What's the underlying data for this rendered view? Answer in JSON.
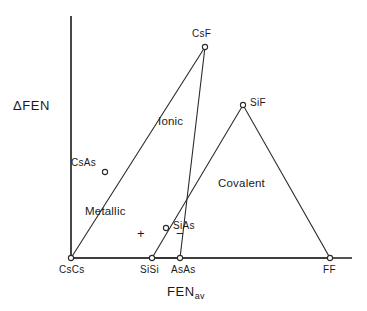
{
  "chart_data": {
    "type": "line",
    "title": "",
    "xlabel": "FEN_av",
    "ylabel": "ΔFEN",
    "grid": false,
    "legend": "none",
    "axes": {
      "x_axis_label_main": "FEN",
      "x_axis_label_sub": "av",
      "y_axis_label": "ΔFEN",
      "x_range_pixels": [
        71,
        352
      ],
      "y_range_pixels": [
        258,
        16
      ]
    },
    "vertices": [
      {
        "name": "CsCs",
        "x": 71,
        "y": 258,
        "marker": true,
        "label_pos": "below"
      },
      {
        "name": "SiSi",
        "x": 152,
        "y": 258,
        "marker": true,
        "label_pos": "below"
      },
      {
        "name": "AsAs",
        "x": 180,
        "y": 258,
        "marker": true,
        "label_pos": "below"
      },
      {
        "name": "FF",
        "x": 330,
        "y": 258,
        "marker": true,
        "label_pos": "below"
      },
      {
        "name": "CsAs",
        "x": 105,
        "y": 172,
        "marker": true,
        "label_pos": "left"
      },
      {
        "name": "CsF",
        "x": 205,
        "y": 47,
        "marker": true,
        "label_pos": "above"
      },
      {
        "name": "SiAs",
        "x": 166,
        "y": 228,
        "marker": true,
        "label_pos": "right"
      },
      {
        "name": "SiF",
        "x": 243,
        "y": 105,
        "marker": true,
        "label_pos": "right"
      }
    ],
    "series": [
      {
        "name": "triangle-left",
        "points": [
          [
            71,
            258
          ],
          [
            205,
            47
          ],
          [
            180,
            258
          ],
          [
            71,
            258
          ]
        ]
      },
      {
        "name": "triangle-right",
        "points": [
          [
            152,
            258
          ],
          [
            243,
            105
          ],
          [
            330,
            258
          ],
          [
            152,
            258
          ]
        ]
      }
    ],
    "annotations": [
      {
        "text": "Ionic",
        "x": 158,
        "y": 122
      },
      {
        "text": "Covalent",
        "x": 218,
        "y": 184
      },
      {
        "text": "Metallic",
        "x": 85,
        "y": 212
      },
      {
        "text": "+",
        "x": 141,
        "y": 234
      },
      {
        "text": "−",
        "x": 180,
        "y": 234
      }
    ]
  },
  "labels": {
    "vertex": {
      "csf": "CsF",
      "sif": "SiF",
      "csas": "CsAs",
      "sias": "SiAs"
    },
    "ticks": {
      "cscs": "CsCs",
      "sisi": "SiSi",
      "asas": "AsAs",
      "ff": "FF"
    },
    "regions": {
      "ionic": "Ionic",
      "covalent": "Covalent",
      "metallic": "Metallic"
    },
    "signs": {
      "plus": "+",
      "minus": "−"
    },
    "axis": {
      "y_title": "ΔFEN",
      "x_title_main": "FEN",
      "x_title_sub": "av"
    }
  },
  "colors": {
    "background": "#ffffff",
    "axis": "#1a1a1a",
    "line": "#2b2b2b",
    "text": "#1a1a1a"
  }
}
